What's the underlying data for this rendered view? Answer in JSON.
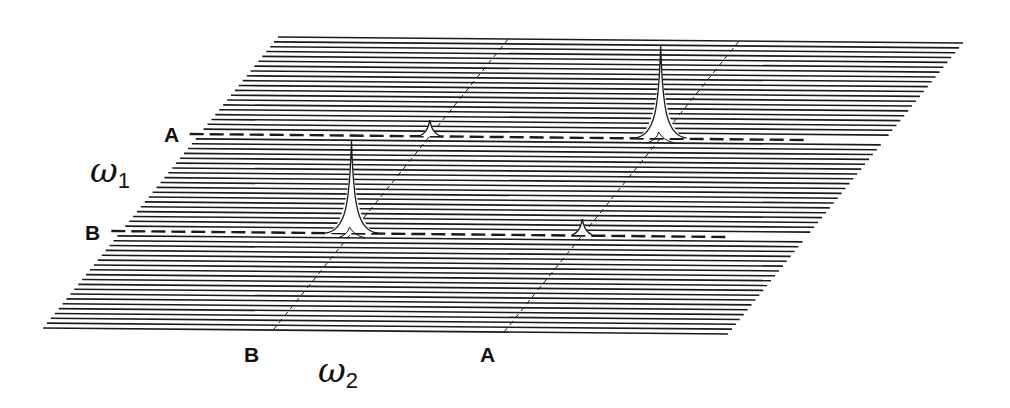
{
  "figure": {
    "type": "2D spectrum stacked-plot (parallelogram projection)",
    "colors": {
      "line": "#1a1a1a",
      "background": "#ffffff"
    },
    "geometry": {
      "top_left": [
        278,
        37
      ],
      "top_right": [
        963,
        43
      ],
      "bottom_left": [
        43,
        328
      ],
      "bottom_right": [
        728,
        334
      ],
      "trace_count": 61
    },
    "axes": {
      "omega1": {
        "symbol": "ω",
        "subscript": "1"
      },
      "omega2": {
        "symbol": "ω",
        "subscript": "2"
      }
    },
    "row_labels": [
      {
        "label": "A",
        "trace_fraction": 0.337
      },
      {
        "label": "B",
        "trace_fraction": 0.674
      }
    ],
    "column_labels": [
      {
        "label": "B",
        "column_fraction": 0.336
      },
      {
        "label": "A",
        "column_fraction": 0.673
      }
    ],
    "peaks": [
      {
        "name": "diagonal-peak-A",
        "row": "A",
        "column": "A",
        "height": 92,
        "type": "strong"
      },
      {
        "name": "diagonal-peak-B",
        "row": "B",
        "column": "B",
        "height": 92,
        "type": "strong"
      },
      {
        "name": "cross-peak-AB",
        "row": "A",
        "column": "B",
        "height": 16,
        "type": "weak"
      },
      {
        "name": "cross-peak-BA",
        "row": "B",
        "column": "A",
        "height": 16,
        "type": "weak"
      }
    ]
  },
  "labels": {
    "row_A": "A",
    "row_B": "B",
    "col_B": "B",
    "col_A": "A",
    "omega1_symbol": "ω",
    "omega1_sub": "1",
    "omega2_symbol": "ω",
    "omega2_sub": "2"
  }
}
